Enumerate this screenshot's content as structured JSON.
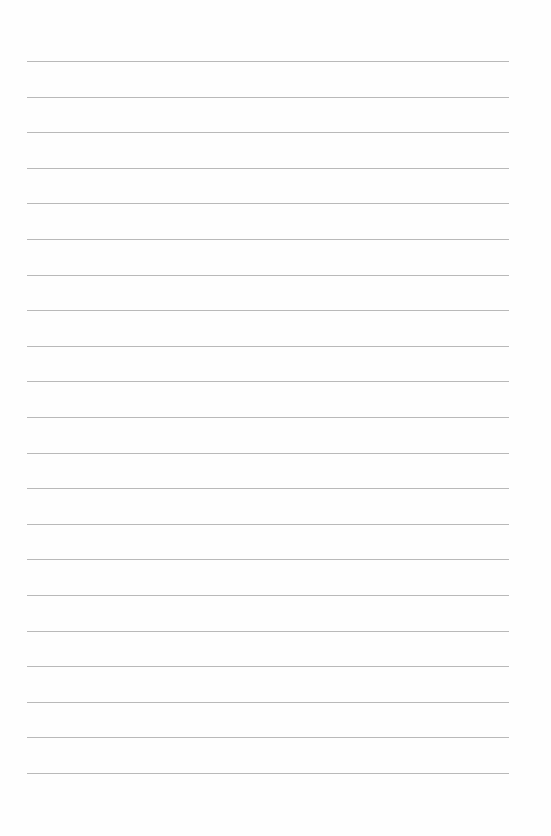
{
  "page": {
    "type": "lined-paper",
    "background_color": "#fefefe",
    "line_color": "#b9b9b9",
    "line_count": 21,
    "first_line_y": 61,
    "line_spacing": 35.6,
    "line_left": 27,
    "line_width": 482
  }
}
